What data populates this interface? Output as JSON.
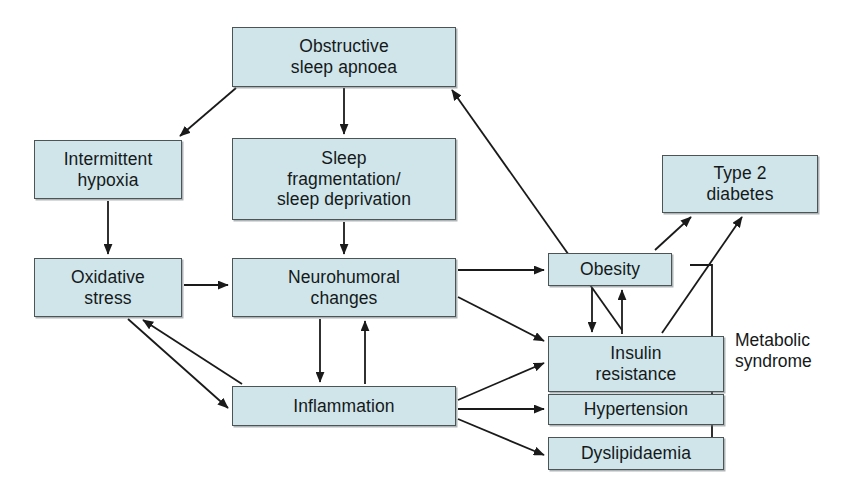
{
  "diagram": {
    "canvas": {
      "width": 845,
      "height": 495
    },
    "style": {
      "node_fill": "#cfe5ea",
      "node_border": "#4c5456",
      "edge_color": "#1a1a1a",
      "text_color": "#15191a",
      "background": "#ffffff"
    },
    "nodes": [
      {
        "id": "osa",
        "label": "Obstructive\nsleep apnoea",
        "x": 232,
        "y": 27,
        "w": 224,
        "h": 60
      },
      {
        "id": "hypoxia",
        "label": "Intermittent\nhypoxia",
        "x": 34,
        "y": 140,
        "w": 148,
        "h": 59
      },
      {
        "id": "fragmentation",
        "label": "Sleep\nfragmentation/\nsleep deprivation",
        "x": 232,
        "y": 138,
        "w": 224,
        "h": 82
      },
      {
        "id": "oxidative",
        "label": "Oxidative\nstress",
        "x": 34,
        "y": 258,
        "w": 148,
        "h": 59
      },
      {
        "id": "neurohumoral",
        "label": "Neurohumoral\nchanges",
        "x": 232,
        "y": 258,
        "w": 224,
        "h": 59
      },
      {
        "id": "obesity",
        "label": "Obesity",
        "x": 548,
        "y": 253,
        "w": 124,
        "h": 33
      },
      {
        "id": "diabetes",
        "label": "Type 2\ndiabetes",
        "x": 662,
        "y": 155,
        "w": 156,
        "h": 58
      },
      {
        "id": "insulin",
        "label": "Insulin\nresistance",
        "x": 548,
        "y": 336,
        "w": 176,
        "h": 56
      },
      {
        "id": "hypertension",
        "label": "Hypertension",
        "x": 548,
        "y": 394,
        "w": 176,
        "h": 31
      },
      {
        "id": "dyslipidaemia",
        "label": "Dyslipidaemia",
        "x": 548,
        "y": 437,
        "w": 176,
        "h": 33
      },
      {
        "id": "inflammation",
        "label": "Inflammation",
        "x": 232,
        "y": 386,
        "w": 224,
        "h": 40
      }
    ],
    "edges": [
      {
        "id": "osa-to-hypoxia",
        "from": "osa",
        "to": "hypoxia",
        "kind": "arrow"
      },
      {
        "id": "osa-to-fragmentation",
        "from": "osa",
        "to": "fragmentation",
        "kind": "arrow"
      },
      {
        "id": "obesity-to-osa",
        "from": "obesity",
        "to": "osa",
        "kind": "arrow"
      },
      {
        "id": "hypoxia-to-oxidative",
        "from": "hypoxia",
        "to": "oxidative",
        "kind": "arrow"
      },
      {
        "id": "fragmentation-to-neuro",
        "from": "fragmentation",
        "to": "neurohumoral",
        "kind": "arrow"
      },
      {
        "id": "oxidative-to-neuro",
        "from": "oxidative",
        "to": "neurohumoral",
        "kind": "arrow"
      },
      {
        "id": "oxidative-to-inflammation",
        "from": "oxidative",
        "to": "inflammation",
        "kind": "arrow"
      },
      {
        "id": "inflammation-to-oxidative",
        "from": "inflammation",
        "to": "oxidative",
        "kind": "arrow"
      },
      {
        "id": "neuro-to-obesity",
        "from": "neurohumoral",
        "to": "obesity",
        "kind": "arrow"
      },
      {
        "id": "neuro-to-insulin",
        "from": "neurohumoral",
        "to": "insulin",
        "kind": "arrow"
      },
      {
        "id": "neuro-to-inflammation",
        "from": "neurohumoral",
        "to": "inflammation",
        "kind": "arrow"
      },
      {
        "id": "inflammation-to-neuro",
        "from": "inflammation",
        "to": "neurohumoral",
        "kind": "arrow"
      },
      {
        "id": "inflammation-to-insulin",
        "from": "inflammation",
        "to": "insulin",
        "kind": "arrow"
      },
      {
        "id": "inflammation-to-hypertension",
        "from": "inflammation",
        "to": "hypertension",
        "kind": "arrow"
      },
      {
        "id": "inflammation-to-dyslipidaemia",
        "from": "inflammation",
        "to": "dyslipidaemia",
        "kind": "arrow"
      },
      {
        "id": "obesity-to-insulin",
        "from": "obesity",
        "to": "insulin",
        "kind": "arrow"
      },
      {
        "id": "insulin-to-obesity",
        "from": "insulin",
        "to": "obesity",
        "kind": "arrow"
      },
      {
        "id": "obesity-to-diabetes",
        "from": "obesity",
        "to": "diabetes",
        "kind": "arrow"
      },
      {
        "id": "insulin-to-diabetes",
        "from": "insulin",
        "to": "diabetes",
        "kind": "arrow"
      }
    ],
    "annotations": [
      {
        "id": "metabolic-syndrome",
        "label": "Metabolic\nsyndrome",
        "x": 735,
        "y": 330,
        "bracket": {
          "x": 712,
          "top": 265,
          "bottom": 446,
          "arm": 22
        }
      }
    ]
  }
}
